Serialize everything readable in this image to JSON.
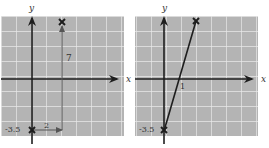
{
  "colors": {
    "grid_bg": "#b4b4b4",
    "grid_line": "#e8e8e8",
    "axis": "#1e1e1e",
    "text": "#333333"
  },
  "panels": [
    {
      "id": "left",
      "x_axis_label": "x",
      "y_axis_label": "y",
      "annotations": {
        "y_intercept": "-3.5",
        "run": "2",
        "rise": "7"
      }
    },
    {
      "id": "right",
      "x_axis_label": "x",
      "y_axis_label": "y",
      "annotations": {
        "y_intercept": "-3.5",
        "x_intercept": "1"
      }
    }
  ]
}
